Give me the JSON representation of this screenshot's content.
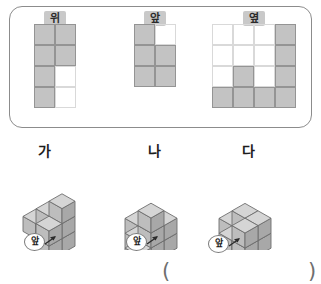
{
  "views_panel": {
    "views": [
      {
        "id": "top",
        "label": "위",
        "cols": 2,
        "rows": 4,
        "filled": [
          [
            1,
            1
          ],
          [
            1,
            1
          ],
          [
            1,
            0
          ],
          [
            1,
            0
          ]
        ]
      },
      {
        "id": "front",
        "label": "앞",
        "cols": 2,
        "rows": 3,
        "filled": [
          [
            1,
            0
          ],
          [
            1,
            1
          ],
          [
            1,
            1
          ]
        ]
      },
      {
        "id": "side",
        "label": "옆",
        "cols": 4,
        "rows": 4,
        "filled": [
          [
            0,
            0,
            0,
            1
          ],
          [
            0,
            0,
            0,
            1
          ],
          [
            0,
            1,
            0,
            1
          ],
          [
            1,
            1,
            1,
            1
          ]
        ],
        "column_heights": [
          1,
          2,
          1,
          3
        ]
      }
    ]
  },
  "solids": [
    {
      "id": "ga",
      "name": "가",
      "front_label": "앞",
      "cube_count": 8
    },
    {
      "id": "na",
      "name": "나",
      "front_label": "앞",
      "cube_count": 9
    },
    {
      "id": "da",
      "name": "다",
      "front_label": "앞",
      "cube_count": 8
    }
  ],
  "answer": {
    "open_paren": "(",
    "close_paren": ")",
    "value": ""
  },
  "colors": {
    "panel_border": "#8c8c8c",
    "cell_fill": "#c3c3c3",
    "cell_border": "#949494",
    "grid_line": "#d9d9d9",
    "label_badge": "#c9c9c9",
    "cube_top": "#d5d5d5",
    "cube_left": "#bdbdbd",
    "cube_right": "#a8a8a8",
    "cube_edge": "#6e6e6e",
    "text": "#1d1d1d"
  }
}
